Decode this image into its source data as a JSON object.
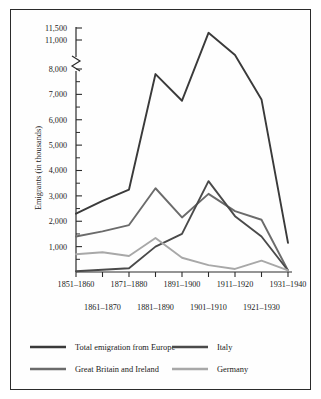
{
  "chart_data": {
    "type": "line",
    "title": "",
    "xlabel": "",
    "ylabel": "Emigrants (in thousands)",
    "grid": false,
    "legend_position": "bottom",
    "axis_break": {
      "present": true,
      "between": [
        8000,
        11000
      ],
      "note": "y-axis broken between 8,000 and 11,000"
    },
    "ylim": [
      0,
      11500
    ],
    "yticks": [
      1000,
      2000,
      3000,
      4000,
      5000,
      6000,
      7000,
      8000,
      11000,
      11500
    ],
    "ytick_labels": [
      "1,000",
      "2,000",
      "3,000",
      "4,000",
      "5,000",
      "6,000",
      "7,000",
      "8,000",
      "11,000",
      "11,500"
    ],
    "categories": [
      "1851–1860",
      "1861–1870",
      "1871–1880",
      "1881–1890",
      "1891–1900",
      "1901–1910",
      "1911–1920",
      "1921–1930",
      "1931–1940"
    ],
    "categories_row_top": [
      "1851–1860",
      "1871–1880",
      "1891–1900",
      "1911–1920",
      "1931–1940"
    ],
    "categories_row_bottom": [
      "1861–1870",
      "1881–1890",
      "1901–1910",
      "1921–1930"
    ],
    "series": [
      {
        "name": "Total emigration from Europe",
        "color": "#3a3a3a",
        "values": [
          2300,
          2800,
          3250,
          7800,
          6750,
          11300,
          9050,
          6800,
          1150
        ]
      },
      {
        "name": "Great Britain and Ireland",
        "color": "#6b6b6b",
        "values": [
          1400,
          1600,
          1850,
          3300,
          2150,
          3080,
          2400,
          2060,
          60
        ]
      },
      {
        "name": "Italy",
        "color": "#4a4a4a",
        "values": [
          30,
          90,
          150,
          1000,
          1500,
          3580,
          2200,
          1400,
          60
        ]
      },
      {
        "name": "Germany",
        "color": "#a8a8a8",
        "values": [
          700,
          780,
          630,
          1340,
          560,
          270,
          120,
          450,
          60
        ]
      }
    ]
  },
  "legend": {
    "items": [
      {
        "label": "Total emigration from Europe",
        "color": "#3a3a3a"
      },
      {
        "label": "Italy",
        "color": "#4a4a4a"
      },
      {
        "label": "Great Britain and Ireland",
        "color": "#6b6b6b"
      },
      {
        "label": "Germany",
        "color": "#a8a8a8"
      }
    ]
  }
}
